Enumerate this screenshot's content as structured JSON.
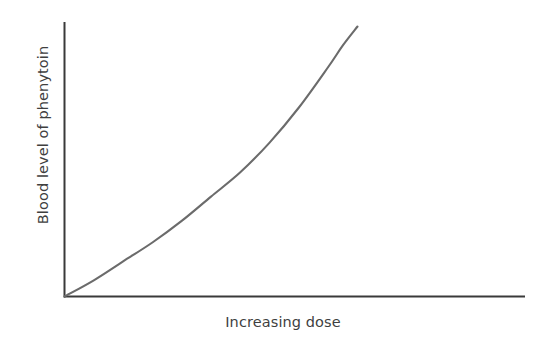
{
  "chart_data": {
    "type": "line",
    "title": "",
    "subtitle": "",
    "xlabel": "Increasing dose",
    "ylabel": "Blood level of phenytoin",
    "grid": false,
    "legend": null,
    "axis_ticks": {
      "x": [],
      "y": []
    },
    "xlim": [
      0,
      100
    ],
    "ylim": [
      0,
      100
    ],
    "annotations": [],
    "series": [
      {
        "name": "Phenytoin blood level vs dose",
        "color": "#6b6b6b",
        "x": [
          0,
          10,
          20,
          30,
          40,
          50,
          60,
          70,
          80,
          90,
          95,
          100
        ],
        "y": [
          0,
          6,
          13,
          20,
          28,
          37,
          46,
          57,
          70,
          85,
          93,
          100
        ]
      }
    ]
  },
  "axes": {
    "y_axis_color": "#3a3a3a",
    "x_axis_color": "#3a3a3a",
    "curve_color": "#6b6b6b",
    "background_color": "#ffffff",
    "label_color": "#3f3f3f"
  },
  "geometry": {
    "origin_x": 64,
    "origin_y": 297,
    "y_axis_top": 22,
    "x_axis_right": 525,
    "curve_end_x": 357,
    "curve_end_y": 27
  }
}
